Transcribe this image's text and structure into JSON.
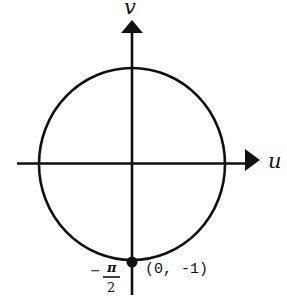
{
  "diagram": {
    "type": "unit-circle-uv-plane",
    "axes": {
      "horizontal": {
        "label": "u"
      },
      "vertical": {
        "label": "v"
      }
    },
    "circle": {
      "center": [
        0,
        0
      ],
      "radius": 1
    },
    "marked_point": {
      "coords_label": "(0, -1)",
      "angle_label": {
        "sign": "−",
        "numerator": "π",
        "denominator": "2"
      }
    },
    "colors": {
      "stroke": "#111111",
      "background": "#ffffff"
    }
  }
}
